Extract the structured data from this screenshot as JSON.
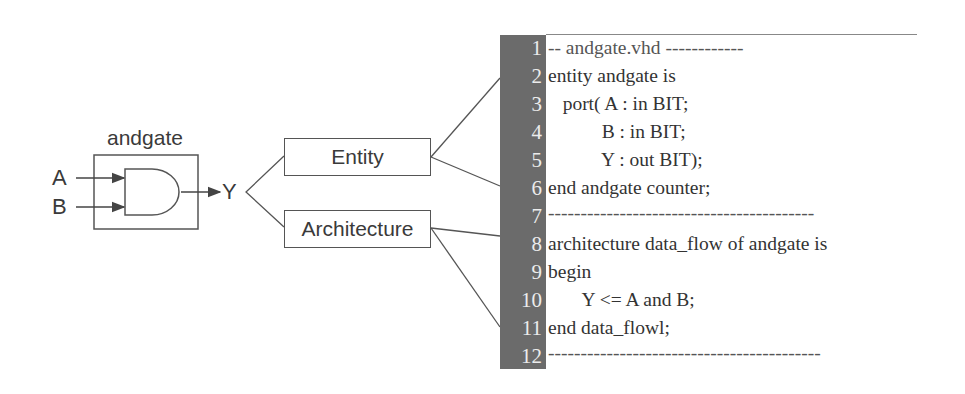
{
  "block": {
    "title": "andgate",
    "inputs": [
      "A",
      "B"
    ],
    "output": "Y"
  },
  "parts": {
    "entity_label": "Entity",
    "architecture_label": "Architecture"
  },
  "code": {
    "lines": [
      {
        "n": "1",
        "text": "-- andgate.vhd ------------"
      },
      {
        "n": "2",
        "text": "entity andgate is"
      },
      {
        "n": "3",
        "text": "   port( A : in BIT;"
      },
      {
        "n": "4",
        "text": "           B : in BIT;"
      },
      {
        "n": "5",
        "text": "           Y : out BIT);"
      },
      {
        "n": "6",
        "text": "end andgate counter;"
      },
      {
        "n": "7",
        "text": "-----------------------------------------"
      },
      {
        "n": "8",
        "text": "architecture data_flow of andgate is"
      },
      {
        "n": "9",
        "text": "begin"
      },
      {
        "n": "10",
        "text": "       Y <= A and B;"
      },
      {
        "n": "11",
        "text": "end data_flowl;"
      },
      {
        "n": "12",
        "text": "------------------------------------------"
      }
    ]
  },
  "colors": {
    "gutter": "#6b6b6b",
    "line_numbers": "#ececec",
    "stroke": "#555555"
  }
}
